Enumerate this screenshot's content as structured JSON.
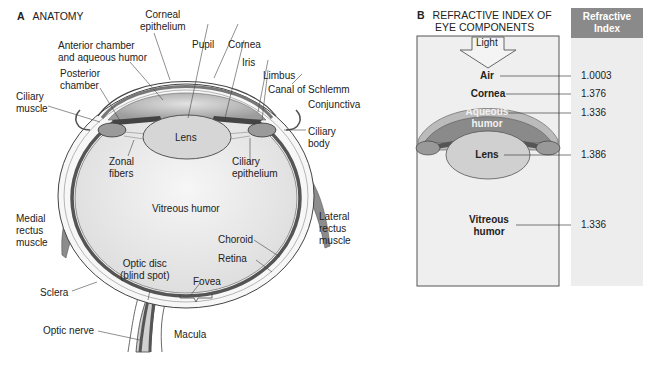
{
  "panel_a": {
    "letter": "A",
    "title": "ANATOMY",
    "labels": {
      "corneal_epithelium": [
        "Corneal",
        "epithelium"
      ],
      "anterior_chamber": [
        "Anterior chamber",
        "and aqueous humor"
      ],
      "pupil": "Pupil",
      "cornea": "Cornea",
      "iris": "Iris",
      "limbus": "Limbus",
      "canal_of_schlemm": "Canal of Schlemm",
      "conjunctiva": "Conjunctiva",
      "posterior_chamber": [
        "Posterior",
        "chamber"
      ],
      "ciliary_muscle": [
        "Ciliary",
        "muscle"
      ],
      "lens": "Lens",
      "ciliary_body": [
        "Ciliary",
        "body"
      ],
      "zonal_fibers": [
        "Zonal",
        "fibers"
      ],
      "ciliary_epithelium": [
        "Ciliary",
        "epithelium"
      ],
      "medial_rectus": [
        "Medial",
        "rectus",
        "muscle"
      ],
      "lateral_rectus": [
        "Lateral",
        "rectus",
        "muscle"
      ],
      "vitreous_humor": "Vitreous humor",
      "choroid": "Choroid",
      "retina": "Retina",
      "optic_disc": [
        "Optic disc",
        "(blind spot)"
      ],
      "sclera": "Sclera",
      "fovea": "Fovea",
      "optic_nerve": "Optic nerve",
      "macula": "Macula"
    }
  },
  "panel_b": {
    "letter": "B",
    "title": [
      "REFRACTIVE INDEX OF",
      "EYE COMPONENTS"
    ],
    "light_label": "Light",
    "column_header": [
      "Refractive",
      "Index"
    ],
    "rows": [
      {
        "component": [
          "Air"
        ],
        "index": "1.0003"
      },
      {
        "component": [
          "Cornea"
        ],
        "index": "1.376"
      },
      {
        "component": [
          "Aqueous",
          "humor"
        ],
        "index": "1.336"
      },
      {
        "component": [
          "Lens"
        ],
        "index": "1.386"
      },
      {
        "component": [
          "Vitreous",
          "humor"
        ],
        "index": "1.336"
      }
    ]
  },
  "colors": {
    "sclera_fill": "#f4f4f4",
    "choroid": "#555555",
    "aqueous": "#9a9a9a",
    "lens": "#d6d6d6",
    "vitreous": "#ebebeb",
    "header_gray": "#8a8a8a",
    "column_gray": "#ededed"
  }
}
